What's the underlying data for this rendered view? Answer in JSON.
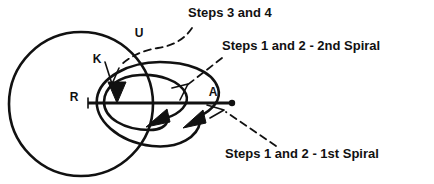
{
  "figure": {
    "background_color": "#ffffff",
    "ink_color": "#111111",
    "width": 434,
    "height": 184
  },
  "annotations": [
    {
      "id": "steps-3-and-4",
      "label": "Steps 3 and 4",
      "x": 188,
      "y": 17,
      "anchor": "start",
      "leader": "dashed-curve-to-circle-arrowhead"
    },
    {
      "id": "steps-1-2-2nd-spiral",
      "label": "Steps 1 and 2 - 2nd Spiral",
      "x": 222,
      "y": 50,
      "anchor": "start",
      "leader": "dashed-line-to-inner-spiral"
    },
    {
      "id": "steps-1-2-1st-spiral",
      "label": "Steps 1 and 2 - 1st Spiral",
      "x": 225,
      "y": 158,
      "anchor": "start",
      "leader": "dashed-line-to-outer-spiral"
    }
  ],
  "node_labels": [
    {
      "id": "label-u",
      "label": "U",
      "x": 139,
      "y": 37
    },
    {
      "id": "label-k",
      "label": "K",
      "x": 97,
      "y": 63
    },
    {
      "id": "label-r",
      "label": "R",
      "x": 74,
      "y": 101
    },
    {
      "id": "label-a",
      "label": "A",
      "x": 213,
      "y": 96
    }
  ],
  "shapes": {
    "outer_circle_k": {
      "cx": 81,
      "cy": 104,
      "r": 72
    },
    "outer_spiral_ellipse": {
      "cx": 160,
      "cy": 110,
      "rx": 63,
      "ry": 40
    },
    "inner_spiral_ellipse": {
      "cx": 147,
      "cy": 106,
      "rx": 45,
      "ry": 30
    },
    "axis_line": {
      "x1": 88,
      "y1": 103,
      "x2": 232,
      "y2": 103
    },
    "axis_endpoint_dot": {
      "cx": 232,
      "cy": 103,
      "r": 3
    }
  },
  "arrowheads": [
    {
      "id": "arrowhead-steps-3-4-on-circle",
      "x": 117,
      "y": 92,
      "direction": "down"
    },
    {
      "id": "arrowhead-inner-spiral",
      "x": 161,
      "y": 117,
      "direction": "right-up"
    },
    {
      "id": "arrowhead-outer-spiral",
      "x": 196,
      "y": 118,
      "direction": "right-up"
    }
  ],
  "pointer_arrows": [
    {
      "id": "pointer-steps-3-4",
      "target_x": 110,
      "target_y": 82
    },
    {
      "id": "pointer-2nd-spiral",
      "target_x": 177,
      "target_y": 92
    },
    {
      "id": "pointer-1st-spiral",
      "target_x": 203,
      "target_y": 110
    }
  ]
}
